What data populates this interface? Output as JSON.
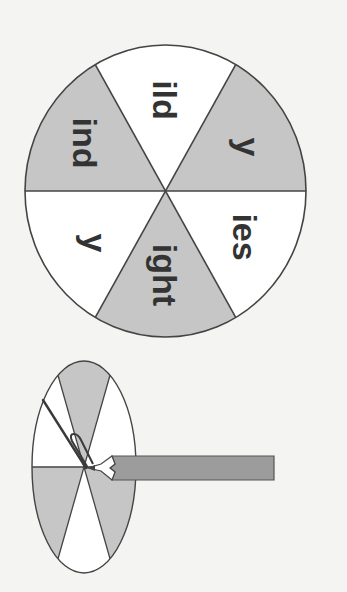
{
  "diagram": {
    "colors": {
      "background": "#f4f4f2",
      "shaded_sector": "#c6c6c6",
      "plain_sector": "#ffffff",
      "outline": "#444444",
      "text": "#333333",
      "pencil": "#9c9c9c"
    },
    "big_wheel": {
      "sectors": [
        {
          "label": "ild",
          "position": "top",
          "shaded": false
        },
        {
          "label": "y",
          "position": "upper-right",
          "shaded": true
        },
        {
          "label": "ies",
          "position": "lower-right",
          "shaded": false
        },
        {
          "label": "ight",
          "position": "bottom",
          "shaded": true
        },
        {
          "label": "y",
          "position": "lower-left",
          "shaded": false
        },
        {
          "label": "ind",
          "position": "upper-left",
          "shaded": true
        }
      ]
    },
    "small_spinner": {
      "description": "Spinner illustration: pencil holding a paper clip at center of a six-sector wheel",
      "parts": [
        "wheel",
        "paper-clip",
        "pencil"
      ]
    }
  }
}
